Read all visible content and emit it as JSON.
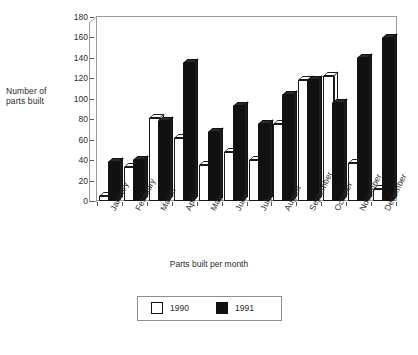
{
  "chart_data": {
    "type": "bar",
    "title": "",
    "xlabel": "Parts built per month",
    "ylabel": "Number of parts built",
    "categories": [
      "January",
      "February",
      "March",
      "April",
      "May",
      "June",
      "July",
      "August",
      "September",
      "October",
      "November",
      "December"
    ],
    "series": [
      {
        "name": "1990",
        "color": "#ffffff",
        "values": [
          5,
          33,
          81,
          62,
          35,
          48,
          40,
          75,
          118,
          122,
          37,
          12
        ]
      },
      {
        "name": "1991",
        "color": "#111111",
        "values": [
          38,
          40,
          78,
          135,
          68,
          93,
          75,
          104,
          118,
          96,
          140,
          159
        ]
      }
    ],
    "ylim": [
      0,
      180
    ],
    "yticks": [
      0,
      20,
      40,
      60,
      80,
      100,
      120,
      140,
      160,
      180
    ],
    "grid": false,
    "legend_position": "bottom",
    "style": "3d-columns"
  },
  "labels": {
    "y_axis_title": "Number of\nparts built",
    "y_axis_title_line1": "Number of",
    "y_axis_title_line2": "parts built",
    "x_axis_title": "Parts built per month"
  },
  "legend": {
    "entries": [
      {
        "label": "1990",
        "swatch": "white-square"
      },
      {
        "label": "1991",
        "swatch": "black-square"
      }
    ]
  }
}
